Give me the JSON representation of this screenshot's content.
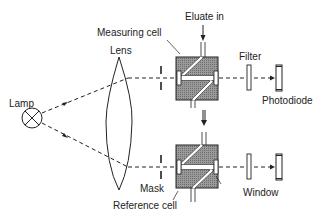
{
  "diagram": {
    "labels": {
      "lamp": "Lamp",
      "lens": "Lens",
      "measuring_cell": "Measuring cell",
      "eluate_in": "Eluate in",
      "filter": "Filter",
      "photodiode": "Photodiode",
      "mask": "Mask",
      "reference_cell": "Reference cell",
      "window": "Window"
    },
    "colors": {
      "line": "#222222",
      "cell_fill": "#8a8a8a",
      "background": "#ffffff"
    }
  }
}
